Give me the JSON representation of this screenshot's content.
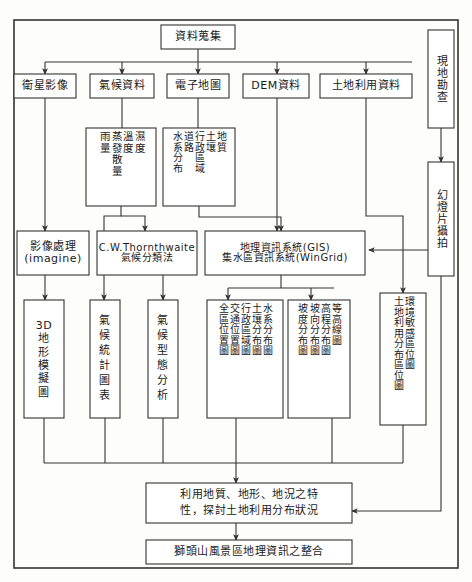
{
  "diagram": {
    "title_top": "資料蒐集",
    "sources": [
      {
        "id": "satellite",
        "label": "衛星影像"
      },
      {
        "id": "climate",
        "label": "氣候資料"
      },
      {
        "id": "emap",
        "label": "電子地圖"
      },
      {
        "id": "dem",
        "label": "DEM資料"
      },
      {
        "id": "landuse",
        "label": "土地利用資料"
      }
    ],
    "field": [
      {
        "id": "survey",
        "label": "現地勘查"
      },
      {
        "id": "slide",
        "label": "幻燈片攝拍"
      }
    ],
    "climate_params": {
      "columns": [
        "濕度",
        "溫度",
        "蒸發散量",
        "雨量"
      ]
    },
    "emap_params": {
      "columns": [
        "地質",
        "土壤",
        "行政區域",
        "道路",
        "水系分布"
      ]
    },
    "processes": [
      {
        "id": "imgproc",
        "label": "影像處理\n(imagine)"
      },
      {
        "id": "thornthwaite",
        "label": "C.W.Thornthwaite\n氣候分類法"
      },
      {
        "id": "gis",
        "label": "地理資訊系統(GIS)\n集水區資訊系統(WinGrid)"
      }
    ],
    "outputs": [
      {
        "id": "out3d",
        "label": "3D\n地\n形\n模\n擬\n圖"
      },
      {
        "id": "climstat",
        "label": "氣\n候\n統\n計\n圖\n表"
      },
      {
        "id": "climtype",
        "label": "氣\n候\n型\n態\n分\n析"
      }
    ],
    "map_outputs": [
      {
        "id": "maps_a",
        "columns": [
          "水系分布圖",
          "土壤分布圖",
          "行政區域圖",
          "交通位置圖",
          "全區位置圖"
        ]
      },
      {
        "id": "maps_b",
        "columns": [
          "等高線圖",
          "高程分布圖",
          "坡向分布圖",
          "坡度分布圖"
        ]
      },
      {
        "id": "maps_c",
        "columns": [
          "環境敏感區位圖",
          "土地利用分布區位圖"
        ]
      }
    ],
    "conclusions": [
      {
        "id": "analysis",
        "label": "利用地質、地形、地況之特\n性，探討土地利用分布狀況"
      },
      {
        "id": "integration",
        "label": "獅頭山風景區地理資訊之整合"
      }
    ],
    "colors": {
      "stroke": "#333333",
      "box_fill": "#ffffff",
      "page_bg": "#fdfdfb",
      "text": "#1a1a1a"
    }
  }
}
